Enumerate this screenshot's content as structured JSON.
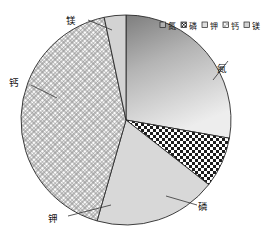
{
  "chart_data": {
    "type": "pie",
    "title": "",
    "subtitle": "",
    "xlabel": "",
    "ylabel": "",
    "grid": false,
    "legend_position": "top-right",
    "categories": [
      "氮",
      "磷",
      "钾",
      "钙",
      "镁"
    ],
    "values": [
      27.8,
      7.8,
      18.9,
      42.2,
      3.3
    ],
    "slices": [
      {
        "label": "氮",
        "value": 27.8,
        "start_angle": 0,
        "end_angle": 100,
        "fill_style": "gradient-gray",
        "fill": "#b9b9b9",
        "callout_x": 222,
        "callout_y": 69,
        "leader_from_x": 213,
        "leader_from_y": 80,
        "leader_to_x": 228,
        "leader_to_y": 61
      },
      {
        "label": "磷",
        "value": 7.8,
        "start_angle": 100,
        "end_angle": 128,
        "fill_style": "checker",
        "fill": "#ffffff",
        "callout_x": 203,
        "callout_y": 207,
        "leader_from_x": 166,
        "leader_from_y": 196,
        "leader_to_x": 197,
        "leader_to_y": 205
      },
      {
        "label": "钾",
        "value": 18.9,
        "start_angle": 128,
        "end_angle": 196,
        "fill_style": "solid-lightgray",
        "fill": "#d8d8d8",
        "callout_x": 53,
        "callout_y": 219,
        "leader_from_x": 111,
        "leader_from_y": 205,
        "leader_to_x": 68,
        "leader_to_y": 216
      },
      {
        "label": "钙",
        "value": 42.2,
        "start_angle": 196,
        "end_angle": 348,
        "fill_style": "diagonal-crosshatch",
        "fill": "#ffffff",
        "callout_x": 14,
        "callout_y": 83,
        "leader_from_x": 57,
        "leader_from_y": 98,
        "leader_to_x": 31,
        "leader_to_y": 85
      },
      {
        "label": "镁",
        "value": 3.3,
        "start_angle": 348,
        "end_angle": 360,
        "fill_style": "solid-lightgray",
        "fill": "#d3d3d3",
        "callout_x": 71,
        "callout_y": 21,
        "leader_from_x": 112,
        "leader_from_y": 30,
        "leader_to_x": 88,
        "leader_to_y": 20
      }
    ],
    "legend": [
      {
        "label": "氮",
        "fill_style": "gradient-gray",
        "fill": "#b0b0b0"
      },
      {
        "label": "磷",
        "fill_style": "checker",
        "fill": "#6e6e6e"
      },
      {
        "label": "钾",
        "fill_style": "solid-lightgray",
        "fill": "#dedede"
      },
      {
        "label": "钙",
        "fill_style": "diagonal-crosshatch",
        "fill": "#efefef"
      },
      {
        "label": "镁",
        "fill_style": "solid-lightgray",
        "fill": "#d3d3d3"
      }
    ],
    "geometry": {
      "center_x": 126,
      "center_y": 120,
      "radius": 105
    },
    "colors": {
      "outline": "#2a2a2a",
      "background": "#ffffff",
      "text": "#111111"
    }
  }
}
